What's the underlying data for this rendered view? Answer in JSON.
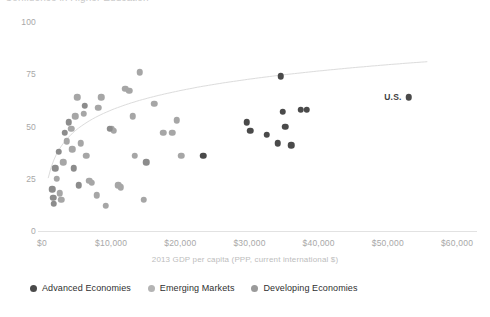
{
  "chart_data": {
    "type": "scatter",
    "title": "Confidence in Higher Education",
    "xlabel": "2013 GDP per capita (PPP, current international $)",
    "ylabel": "",
    "xlim": [
      0,
      62000
    ],
    "ylim": [
      0,
      100
    ],
    "xticks": [
      "$0",
      "$10,000",
      "$20,000",
      "$30,000",
      "$40,000",
      "$50,000",
      "$60,000"
    ],
    "xtick_values": [
      0,
      10000,
      20000,
      30000,
      40000,
      50000,
      60000
    ],
    "yticks": [
      "0",
      "25",
      "50",
      "75",
      "100"
    ],
    "ytick_values": [
      0,
      25,
      50,
      75,
      100
    ],
    "grid": false,
    "legend_position": "bottom-left",
    "trendline": {
      "present": true,
      "type": "logarithmic",
      "color": "#dcdcdc"
    },
    "annotations": [
      {
        "text": "U.S.",
        "x": 53000,
        "y": 64
      }
    ],
    "series": [
      {
        "name": "Advanced Economies",
        "color": "#4a4a4a",
        "points": [
          {
            "x": 34500,
            "y": 74
          },
          {
            "x": 29600,
            "y": 52
          },
          {
            "x": 30100,
            "y": 48
          },
          {
            "x": 32500,
            "y": 46
          },
          {
            "x": 34100,
            "y": 42
          },
          {
            "x": 34800,
            "y": 57
          },
          {
            "x": 35200,
            "y": 50
          },
          {
            "x": 36000,
            "y": 41
          },
          {
            "x": 37400,
            "y": 58
          },
          {
            "x": 38300,
            "y": 58
          },
          {
            "x": 53000,
            "y": 64
          },
          {
            "x": 23300,
            "y": 36
          }
        ]
      },
      {
        "name": "Emerging Markets",
        "color": "#a6a6a6",
        "points": [
          {
            "x": 2100,
            "y": 25
          },
          {
            "x": 2600,
            "y": 18
          },
          {
            "x": 2800,
            "y": 15
          },
          {
            "x": 3100,
            "y": 33
          },
          {
            "x": 3600,
            "y": 43
          },
          {
            "x": 4200,
            "y": 49
          },
          {
            "x": 4400,
            "y": 39
          },
          {
            "x": 4800,
            "y": 55
          },
          {
            "x": 5100,
            "y": 64
          },
          {
            "x": 5600,
            "y": 42
          },
          {
            "x": 6000,
            "y": 56
          },
          {
            "x": 6400,
            "y": 36
          },
          {
            "x": 6800,
            "y": 24
          },
          {
            "x": 7200,
            "y": 23
          },
          {
            "x": 7900,
            "y": 17
          },
          {
            "x": 8100,
            "y": 59
          },
          {
            "x": 8600,
            "y": 64
          },
          {
            "x": 9200,
            "y": 12
          },
          {
            "x": 10100,
            "y": 49
          },
          {
            "x": 10400,
            "y": 48
          },
          {
            "x": 11000,
            "y": 22
          },
          {
            "x": 11400,
            "y": 21
          },
          {
            "x": 12000,
            "y": 68
          },
          {
            "x": 12600,
            "y": 67
          },
          {
            "x": 13100,
            "y": 55
          },
          {
            "x": 13400,
            "y": 36
          },
          {
            "x": 14100,
            "y": 76
          },
          {
            "x": 14700,
            "y": 15
          },
          {
            "x": 16200,
            "y": 61
          },
          {
            "x": 17500,
            "y": 47
          },
          {
            "x": 18800,
            "y": 47
          },
          {
            "x": 19500,
            "y": 53
          },
          {
            "x": 20100,
            "y": 36
          }
        ]
      },
      {
        "name": "Developing Economies",
        "color": "#8c8c8c",
        "points": [
          {
            "x": 1500,
            "y": 20
          },
          {
            "x": 1600,
            "y": 16
          },
          {
            "x": 1700,
            "y": 13
          },
          {
            "x": 1900,
            "y": 30
          },
          {
            "x": 2400,
            "y": 38
          },
          {
            "x": 3300,
            "y": 47
          },
          {
            "x": 3900,
            "y": 52
          },
          {
            "x": 4600,
            "y": 30
          },
          {
            "x": 5300,
            "y": 22
          },
          {
            "x": 6200,
            "y": 60
          },
          {
            "x": 9800,
            "y": 49
          },
          {
            "x": 15100,
            "y": 33
          }
        ]
      }
    ]
  },
  "legend": {
    "items": [
      {
        "label": "Advanced Economies",
        "color": "#4a4a4a"
      },
      {
        "label": "Emerging Markets",
        "color": "#b4b4b4"
      },
      {
        "label": "Developing Economies",
        "color": "#9a9a9a"
      }
    ]
  }
}
